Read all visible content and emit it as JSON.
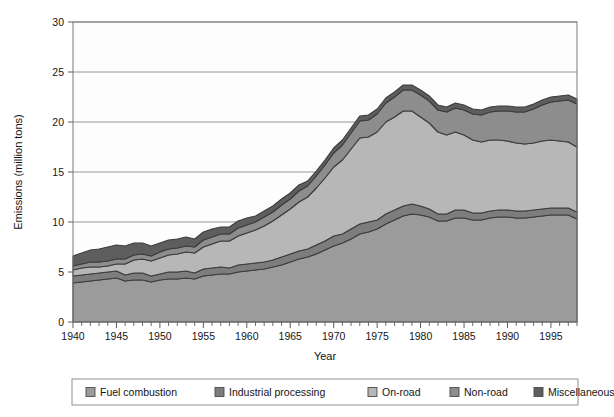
{
  "chart_data": {
    "type": "area",
    "stacked": true,
    "title": "",
    "xlabel": "Year",
    "ylabel": "Emissions (million tons)",
    "xlim": [
      1940,
      1998
    ],
    "ylim": [
      0,
      30
    ],
    "ytick_step": 5,
    "yticks": [
      0,
      5,
      10,
      15,
      20,
      25,
      30
    ],
    "ytick_labels": [
      "0",
      "5",
      "10",
      "15",
      "20",
      "25",
      "30"
    ],
    "xticks": [
      1940,
      1945,
      1950,
      1955,
      1960,
      1965,
      1970,
      1975,
      1980,
      1985,
      1990,
      1995
    ],
    "xtick_labels": [
      "1940",
      "1945",
      "1950",
      "1955",
      "1960",
      "1965",
      "1970",
      "1975",
      "1980",
      "1985",
      "1990",
      "1995"
    ],
    "xtick_minor_step": 1,
    "grid": "horizontal",
    "legend_position": "bottom-outside",
    "x": [
      1940,
      1941,
      1942,
      1943,
      1944,
      1945,
      1946,
      1947,
      1948,
      1949,
      1950,
      1951,
      1952,
      1953,
      1954,
      1955,
      1956,
      1957,
      1958,
      1959,
      1960,
      1961,
      1962,
      1963,
      1964,
      1965,
      1966,
      1967,
      1968,
      1969,
      1970,
      1971,
      1972,
      1973,
      1974,
      1975,
      1976,
      1977,
      1978,
      1979,
      1980,
      1981,
      1982,
      1983,
      1984,
      1985,
      1986,
      1987,
      1988,
      1989,
      1990,
      1991,
      1992,
      1993,
      1994,
      1995,
      1996,
      1997,
      1998
    ],
    "series": [
      {
        "name": "Fuel combustion",
        "color": "#9b9b9b",
        "values": [
          3.9,
          4.0,
          4.1,
          4.2,
          4.3,
          4.4,
          4.1,
          4.2,
          4.2,
          4.0,
          4.2,
          4.3,
          4.3,
          4.4,
          4.3,
          4.6,
          4.7,
          4.8,
          4.8,
          5.0,
          5.1,
          5.2,
          5.3,
          5.5,
          5.7,
          6.0,
          6.3,
          6.5,
          6.8,
          7.2,
          7.6,
          7.9,
          8.3,
          8.8,
          9.0,
          9.3,
          9.8,
          10.2,
          10.6,
          10.8,
          10.7,
          10.5,
          10.1,
          10.1,
          10.4,
          10.4,
          10.2,
          10.2,
          10.4,
          10.5,
          10.5,
          10.4,
          10.4,
          10.5,
          10.6,
          10.7,
          10.7,
          10.7,
          10.3
        ]
      },
      {
        "name": "Industrial processing",
        "color": "#7d7d7d",
        "values": [
          0.7,
          0.7,
          0.7,
          0.7,
          0.7,
          0.7,
          0.6,
          0.7,
          0.7,
          0.6,
          0.6,
          0.7,
          0.7,
          0.7,
          0.6,
          0.7,
          0.7,
          0.7,
          0.6,
          0.7,
          0.7,
          0.7,
          0.7,
          0.7,
          0.8,
          0.8,
          0.8,
          0.8,
          0.9,
          0.9,
          1.0,
          0.9,
          1.0,
          1.0,
          1.0,
          0.9,
          1.0,
          1.0,
          1.0,
          1.0,
          0.9,
          0.8,
          0.7,
          0.7,
          0.8,
          0.8,
          0.7,
          0.7,
          0.7,
          0.7,
          0.7,
          0.7,
          0.7,
          0.7,
          0.7,
          0.7,
          0.7,
          0.7,
          0.7
        ]
      },
      {
        "name": "On-road",
        "color": "#b7b7b7",
        "values": [
          0.6,
          0.7,
          0.7,
          0.6,
          0.6,
          0.7,
          1.1,
          1.3,
          1.4,
          1.5,
          1.6,
          1.7,
          1.8,
          1.9,
          2.0,
          2.2,
          2.4,
          2.6,
          2.7,
          2.9,
          3.1,
          3.3,
          3.6,
          3.9,
          4.2,
          4.5,
          4.9,
          5.2,
          5.7,
          6.3,
          6.9,
          7.4,
          8.0,
          8.6,
          8.5,
          8.8,
          9.2,
          9.3,
          9.5,
          9.3,
          8.9,
          8.6,
          8.2,
          7.9,
          7.8,
          7.5,
          7.3,
          7.1,
          7.1,
          7.0,
          6.9,
          6.8,
          6.7,
          6.7,
          6.8,
          6.8,
          6.7,
          6.6,
          6.5
        ]
      },
      {
        "name": "Non-road",
        "color": "#8d8d8d",
        "values": [
          0.4,
          0.4,
          0.5,
          0.5,
          0.5,
          0.5,
          0.5,
          0.5,
          0.5,
          0.5,
          0.6,
          0.6,
          0.6,
          0.6,
          0.6,
          0.7,
          0.7,
          0.7,
          0.7,
          0.8,
          0.8,
          0.8,
          0.9,
          0.9,
          1.0,
          1.0,
          1.1,
          1.1,
          1.2,
          1.3,
          1.4,
          1.5,
          1.6,
          1.7,
          1.7,
          1.8,
          1.9,
          2.0,
          2.1,
          2.1,
          2.2,
          2.2,
          2.2,
          2.3,
          2.4,
          2.5,
          2.6,
          2.7,
          2.8,
          2.9,
          3.0,
          3.1,
          3.2,
          3.4,
          3.6,
          3.8,
          4.0,
          4.2,
          4.3
        ]
      },
      {
        "name": "Miscellaneous",
        "color": "#5e5e5e",
        "values": [
          1.0,
          1.1,
          1.2,
          1.3,
          1.4,
          1.4,
          1.3,
          1.2,
          1.1,
          1.0,
          0.9,
          0.9,
          0.9,
          0.9,
          0.8,
          0.8,
          0.8,
          0.7,
          0.7,
          0.7,
          0.7,
          0.6,
          0.6,
          0.6,
          0.6,
          0.6,
          0.6,
          0.5,
          0.5,
          0.5,
          0.5,
          0.5,
          0.5,
          0.5,
          0.5,
          0.5,
          0.5,
          0.5,
          0.5,
          0.5,
          0.5,
          0.5,
          0.5,
          0.5,
          0.5,
          0.5,
          0.5,
          0.5,
          0.5,
          0.5,
          0.5,
          0.5,
          0.5,
          0.5,
          0.5,
          0.5,
          0.5,
          0.5,
          0.5
        ]
      }
    ]
  },
  "legend": {
    "items": [
      {
        "label": "Fuel combustion",
        "color": "#9b9b9b"
      },
      {
        "label": "Industrial processing",
        "color": "#7d7d7d"
      },
      {
        "label": "On-road",
        "color": "#b7b7b7"
      },
      {
        "label": "Non-road",
        "color": "#8d8d8d"
      },
      {
        "label": "Miscellaneous",
        "color": "#5e5e5e"
      }
    ]
  },
  "axes": {
    "x_title": "Year",
    "y_title": "Emissions (million tons)"
  }
}
